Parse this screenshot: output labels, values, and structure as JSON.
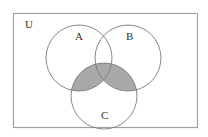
{
  "diagram": {
    "type": "venn",
    "universe_label": "U",
    "sets": [
      {
        "label": "A",
        "cx": 79,
        "cy": 58,
        "r": 33
      },
      {
        "label": "B",
        "cx": 128,
        "cy": 58,
        "r": 33
      },
      {
        "label": "C",
        "cx": 104,
        "cy": 96,
        "r": 33
      }
    ],
    "shaded_region": "(A ∩ C) ∪ (B ∩ C)",
    "colors": {
      "background": "#ffffff",
      "outline": "#8a8a8a",
      "border": "#a0a0a0",
      "shade": "#a9a9a9",
      "text": "#333333"
    }
  }
}
